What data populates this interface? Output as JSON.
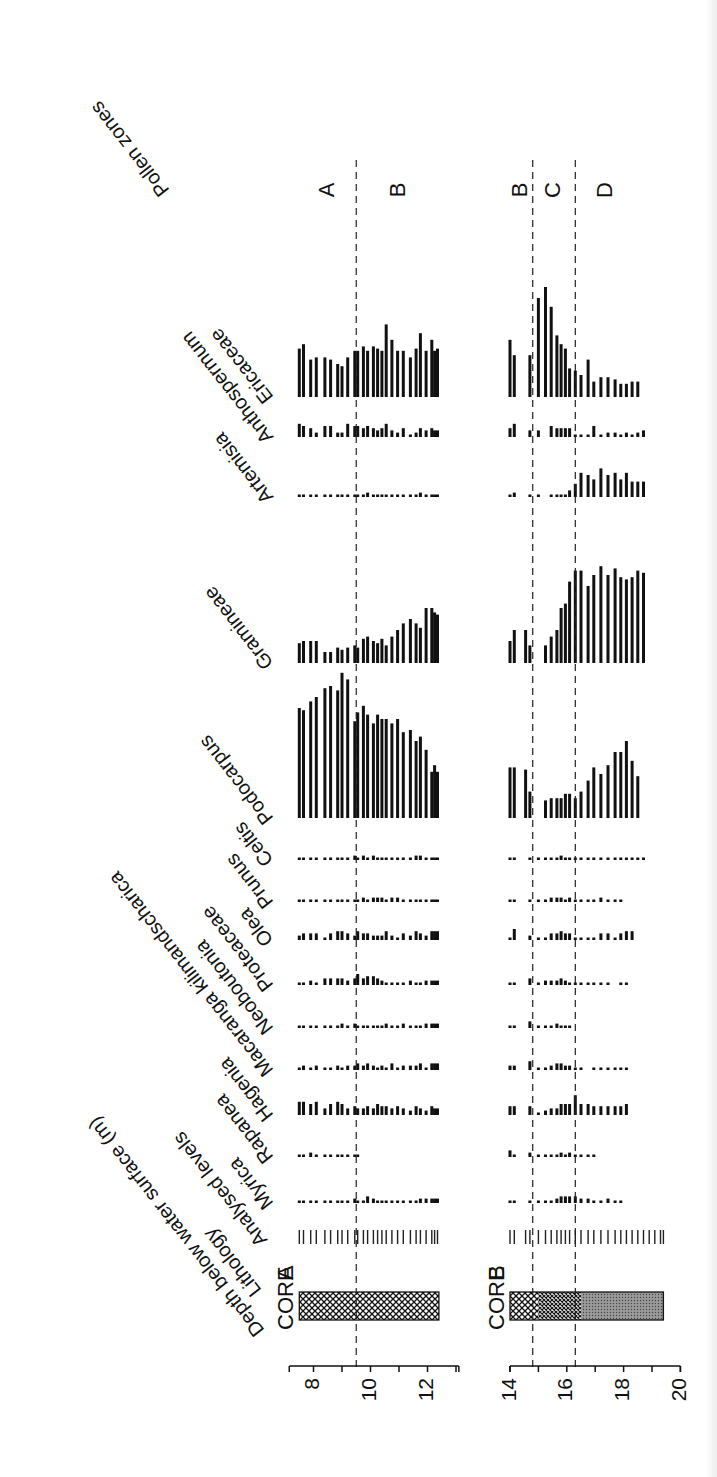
{
  "chart_data": {
    "type": "bar",
    "orientation_note": "Figure rendered rotated; depth runs left-to-right, percentages extend upward",
    "xlabel": "Depth below water surface (m)",
    "ylabel": "Pollen percentage (relative bar length)",
    "labels": {
      "depth": "Depth below water surface (m)",
      "lithology": "Lithology",
      "analysed": "Analysed levels",
      "zones": "Pollen zones"
    },
    "taxa": [
      "Myrica",
      "Rapanea",
      "Hagenia",
      "Macaranga kilimandscharica",
      "Neoboutonia",
      "Proteaceae",
      "Olea",
      "Prunus",
      "Celtis",
      "Podocarpus",
      "Gramineae",
      "Artemisia",
      "Anthospermum",
      "Ericaceae"
    ],
    "cores": [
      {
        "name": "CORE A",
        "core_label": "CORE",
        "core_letter": "A",
        "axis_ticks": [
          8,
          10,
          12
        ],
        "axis_range": [
          7,
          13
        ],
        "lithology": [
          {
            "from": 7.5,
            "to": 12.4,
            "type": "crosshatch"
          }
        ],
        "zone_boundaries": [
          9.5
        ],
        "zones": [
          {
            "label": "A",
            "depth": 8.5
          },
          {
            "label": "B",
            "depth": 11.0
          }
        ],
        "depths": [
          7.5,
          7.65,
          7.9,
          8.1,
          8.4,
          8.6,
          8.85,
          9.0,
          9.2,
          9.45,
          9.55,
          9.75,
          9.9,
          10.1,
          10.25,
          10.4,
          10.55,
          10.75,
          10.95,
          11.15,
          11.4,
          11.6,
          11.75,
          11.95,
          12.15,
          12.25,
          12.35
        ],
        "series": {
          "Ericaceae": [
            22,
            24,
            17,
            18,
            18,
            17,
            15,
            14,
            18,
            21,
            21,
            23,
            21,
            23,
            22,
            21,
            33,
            26,
            21,
            21,
            18,
            22,
            29,
            21,
            26,
            21,
            22
          ],
          "Anthospermum": [
            6,
            5,
            4,
            2,
            5,
            5,
            2,
            2,
            6,
            5,
            5,
            4,
            5,
            4,
            3,
            4,
            6,
            3,
            2,
            4,
            1,
            2,
            4,
            3,
            4,
            3,
            3
          ],
          "Artemisia": [
            1,
            1,
            1,
            1,
            1,
            1,
            1,
            1,
            1,
            1,
            1,
            1,
            2,
            1,
            1,
            1,
            1,
            1,
            1,
            1,
            1,
            1,
            2,
            1,
            1,
            1,
            1
          ],
          "Gramineae": [
            9,
            10,
            10,
            10,
            5,
            5,
            7,
            6,
            7,
            8,
            7,
            11,
            12,
            10,
            9,
            11,
            8,
            12,
            15,
            18,
            20,
            18,
            16,
            25,
            25,
            23,
            22
          ],
          "Podocarpus": [
            50,
            49,
            53,
            55,
            59,
            60,
            58,
            66,
            63,
            44,
            48,
            51,
            47,
            43,
            47,
            45,
            45,
            43,
            45,
            39,
            40,
            35,
            37,
            31,
            21,
            24,
            21
          ],
          "Celtis": [
            1,
            1,
            1,
            1,
            1,
            1,
            1,
            1,
            1,
            2,
            1,
            2,
            1,
            2,
            1,
            1,
            1,
            1,
            1,
            1,
            1,
            2,
            2,
            1,
            1,
            1,
            1
          ],
          "Prunus": [
            1,
            1,
            1,
            1,
            1,
            1,
            1,
            1,
            1,
            1,
            1,
            2,
            1,
            2,
            2,
            2,
            1,
            2,
            2,
            1,
            1,
            1,
            1,
            1,
            1,
            1,
            1
          ],
          "Olea": [
            2,
            3,
            3,
            3,
            1,
            3,
            4,
            4,
            3,
            2,
            4,
            3,
            3,
            2,
            2,
            2,
            4,
            2,
            1,
            3,
            2,
            4,
            3,
            2,
            4,
            4,
            4
          ],
          "Proteaceae": [
            1,
            1,
            2,
            1,
            3,
            3,
            3,
            3,
            2,
            3,
            5,
            3,
            4,
            4,
            3,
            2,
            1,
            1,
            1,
            1,
            2,
            1,
            1,
            2,
            2,
            2,
            2
          ],
          "Neoboutonia": [
            1,
            1,
            1,
            1,
            1,
            1,
            1,
            2,
            1,
            2,
            1,
            1,
            1,
            1,
            1,
            1,
            2,
            1,
            1,
            2,
            1,
            1,
            1,
            2,
            2,
            2,
            2
          ],
          "Macaranga kilimandscharica": [
            1,
            2,
            1,
            2,
            1,
            1,
            2,
            1,
            2,
            2,
            3,
            2,
            3,
            2,
            1,
            2,
            1,
            3,
            1,
            2,
            2,
            2,
            3,
            1,
            3,
            3,
            3
          ],
          "Hagenia": [
            6,
            6,
            5,
            6,
            3,
            5,
            6,
            5,
            3,
            4,
            3,
            3,
            4,
            3,
            5,
            4,
            4,
            3,
            4,
            3,
            2,
            4,
            3,
            2,
            4,
            3,
            3
          ],
          "Rapanea": [
            1,
            1,
            2,
            1,
            1,
            1,
            1,
            1,
            1,
            1,
            1
          ],
          "Myrica": [
            1,
            1,
            1,
            1,
            1,
            1,
            1,
            1,
            1,
            2,
            1,
            1,
            3,
            2,
            1,
            1,
            1,
            1,
            1,
            1,
            1,
            1,
            2,
            2,
            2,
            2,
            2
          ]
        }
      },
      {
        "name": "CORE B",
        "core_label": "CORE",
        "core_letter": "B",
        "axis_ticks": [
          14,
          16,
          18,
          20
        ],
        "axis_range": [
          14,
          20
        ],
        "lithology": [
          {
            "from": 14.0,
            "to": 15.0,
            "type": "crosshatch"
          },
          {
            "from": 15.0,
            "to": 16.5,
            "type": "crosshatch-dense"
          },
          {
            "from": 16.5,
            "to": 19.4,
            "type": "stipple"
          }
        ],
        "zone_boundaries": [
          14.8,
          16.3
        ],
        "zones": [
          {
            "label": "B",
            "depth": 14.4
          },
          {
            "label": "C",
            "depth": 15.55
          },
          {
            "label": "D",
            "depth": 17.4
          }
        ],
        "depths": [
          14.0,
          14.15,
          14.55,
          14.7,
          15.0,
          15.25,
          15.45,
          15.65,
          15.8,
          15.95,
          16.1,
          16.3,
          16.5,
          16.75,
          16.95,
          17.2,
          17.45,
          17.7,
          17.9,
          18.1,
          18.3,
          18.5,
          18.7,
          18.9,
          19.1,
          19.3,
          19.4
        ],
        "series": {
          "Ericaceae": [
            26,
            19,
            0,
            19,
            45,
            50,
            41,
            28,
            24,
            22,
            13,
            12,
            10,
            17,
            7,
            9,
            9,
            8,
            6,
            6,
            7,
            7,
            0,
            0,
            0,
            0,
            0
          ],
          "Anthospermum": [
            4,
            6,
            0,
            3,
            3,
            0,
            5,
            4,
            4,
            4,
            4,
            1,
            1,
            1,
            5,
            1,
            2,
            2,
            1,
            2,
            1,
            2,
            3,
            0,
            0,
            0,
            0
          ],
          "Artemisia": [
            1,
            2,
            0,
            1,
            1,
            0,
            1,
            1,
            1,
            1,
            3,
            6,
            11,
            10,
            8,
            13,
            10,
            11,
            8,
            11,
            7,
            7,
            7,
            0,
            0,
            0,
            0
          ],
          "Gramineae": [
            10,
            15,
            15,
            8,
            0,
            8,
            12,
            15,
            25,
            27,
            37,
            42,
            42,
            35,
            40,
            44,
            40,
            43,
            39,
            38,
            39,
            42,
            41,
            0,
            0,
            0,
            0
          ],
          "Podocarpus": [
            23,
            23,
            22,
            12,
            0,
            8,
            9,
            9,
            9,
            11,
            11,
            9,
            12,
            17,
            23,
            20,
            24,
            30,
            30,
            35,
            26,
            19,
            0,
            0,
            0,
            0,
            0
          ],
          "Celtis": [
            1,
            1,
            0,
            1,
            1,
            1,
            1,
            1,
            2,
            1,
            1,
            1,
            1,
            1,
            1,
            1,
            1,
            1,
            1,
            1,
            1,
            1,
            1,
            0,
            0,
            0,
            0
          ],
          "Prunus": [
            1,
            1,
            0,
            1,
            1,
            1,
            2,
            2,
            2,
            1,
            2,
            1,
            1,
            1,
            1,
            2,
            1,
            1,
            1,
            0,
            0,
            0,
            0,
            0,
            0,
            0,
            0
          ],
          "Olea": [
            1,
            5,
            0,
            2,
            1,
            1,
            3,
            3,
            4,
            3,
            3,
            1,
            1,
            1,
            1,
            3,
            3,
            1,
            3,
            4,
            4,
            0,
            0,
            0,
            0,
            0,
            0
          ],
          "Proteaceae": [
            1,
            1,
            0,
            3,
            1,
            2,
            2,
            2,
            3,
            2,
            1,
            1,
            1,
            1,
            1,
            1,
            1,
            0,
            1,
            1,
            0,
            0,
            0,
            0,
            0,
            0,
            0
          ],
          "Neoboutonia": [
            1,
            1,
            0,
            3,
            1,
            1,
            1,
            2,
            1,
            1,
            1,
            0,
            0,
            0,
            0,
            0,
            0,
            0,
            0,
            0,
            0,
            0,
            0,
            0,
            0,
            0,
            0
          ],
          "Macaranga kilimandscharica": [
            2,
            2,
            0,
            4,
            1,
            1,
            2,
            3,
            3,
            2,
            2,
            1,
            1,
            0,
            1,
            1,
            1,
            1,
            1,
            1,
            0,
            0,
            0,
            0,
            0,
            0,
            0
          ],
          "Hagenia": [
            4,
            4,
            0,
            4,
            1,
            2,
            3,
            3,
            5,
            5,
            5,
            9,
            5,
            5,
            4,
            4,
            4,
            4,
            4,
            5,
            0,
            0,
            0,
            0,
            0,
            0,
            0
          ],
          "Rapanea": [
            3,
            1,
            0,
            2,
            1,
            1,
            1,
            1,
            2,
            1,
            2,
            1,
            1,
            1,
            1,
            0,
            0,
            0,
            0,
            0,
            0,
            0,
            0,
            0,
            0,
            0,
            0
          ],
          "Myrica": [
            1,
            1,
            0,
            1,
            1,
            1,
            1,
            2,
            3,
            3,
            3,
            3,
            2,
            2,
            1,
            1,
            2,
            1,
            1,
            0,
            0,
            0,
            0,
            0,
            0,
            0,
            0
          ]
        }
      }
    ]
  }
}
